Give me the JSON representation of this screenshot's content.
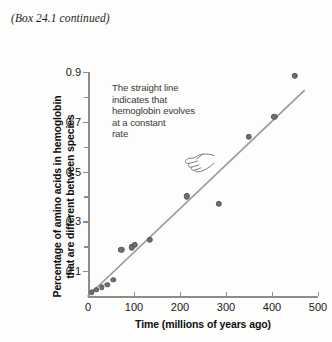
{
  "caption": "(Box 24.1 continued)",
  "annotation": {
    "lines": [
      "The straight line",
      "indicates that",
      "hemoglobin evolves",
      "at a constant",
      "rate"
    ],
    "pointer_icon": "pointing-hand-icon"
  },
  "colors": {
    "point": "#6e6e6e",
    "line": "#9a9a9a",
    "axis": "#8c8c8c",
    "text": "#171717",
    "annotation_text": "#3a3a3a",
    "background": "#fdfdfc"
  },
  "chart_data": {
    "type": "scatter",
    "title": "",
    "xlabel": "Time (millions of years ago)",
    "ylabel": "Percentage of amino acids in hemoglobin that are different between species",
    "ylabel_lines": [
      "Percentage of amino acids in hemoglobin",
      "that are different between species"
    ],
    "xlim": [
      0,
      500
    ],
    "ylim": [
      0,
      0.9
    ],
    "xticks": [
      0,
      100,
      200,
      300,
      400,
      500
    ],
    "xtick_labels": [
      "0",
      "100",
      "200",
      "300",
      "400",
      "500"
    ],
    "yticks": [
      0.1,
      0.2,
      0.3,
      0.4,
      0.5,
      0.6,
      0.7,
      0.8,
      0.9
    ],
    "ytick_labels": [
      "0.1",
      "",
      "0.3",
      "",
      "0.5",
      "",
      "0.7",
      "",
      "0.9"
    ],
    "grid": false,
    "legend": false,
    "points": [
      {
        "x": 8,
        "y": 0.015
      },
      {
        "x": 18,
        "y": 0.025
      },
      {
        "x": 30,
        "y": 0.035
      },
      {
        "x": 42,
        "y": 0.045
      },
      {
        "x": 55,
        "y": 0.065
      },
      {
        "x": 72,
        "y": 0.185
      },
      {
        "x": 95,
        "y": 0.195
      },
      {
        "x": 102,
        "y": 0.205
      },
      {
        "x": 135,
        "y": 0.225
      },
      {
        "x": 215,
        "y": 0.4
      },
      {
        "x": 285,
        "y": 0.37
      },
      {
        "x": 350,
        "y": 0.64
      },
      {
        "x": 405,
        "y": 0.72
      },
      {
        "x": 450,
        "y": 0.885
      }
    ],
    "fit_line": {
      "label": "straight line",
      "x_start": 0,
      "y_start": 0.0,
      "x_end": 470,
      "y_end": 0.825
    }
  }
}
